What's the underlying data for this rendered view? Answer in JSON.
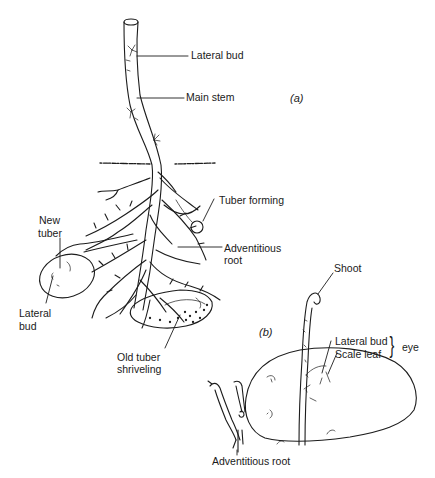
{
  "figure": {
    "panels": {
      "a": {
        "label": "(a)"
      },
      "b": {
        "label": "(b)"
      }
    },
    "labels_a": {
      "lateral_bud_top": "Lateral bud",
      "main_stem": "Main stem",
      "tuber_forming": "Tuber forming",
      "new_tuber_line1": "New",
      "new_tuber_line2": "tuber",
      "adventitious_root_line1": "Adventitious",
      "adventitious_root_line2": "root",
      "lateral_bud_tuber_line1": "Lateral",
      "lateral_bud_tuber_line2": "bud",
      "old_tuber_line1": "Old tuber",
      "old_tuber_line2": "shriveling"
    },
    "labels_b": {
      "shoot": "Shoot",
      "lateral_bud": "Lateral bud",
      "scale_leaf": "Scale leaf",
      "eye_brace": "}",
      "eye": "eye",
      "adventitious_root": "Adventitious root"
    }
  }
}
